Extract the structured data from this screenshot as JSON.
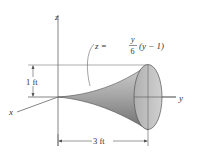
{
  "figure": {
    "axes": {
      "z_label": "z",
      "y_label": "y",
      "x_label": "x"
    },
    "equation": {
      "lhs": "z =",
      "numerator": "y",
      "denominator": "6",
      "factor": "(y − 1)"
    },
    "dimensions": {
      "height": "1 ft",
      "length": "3 ft"
    },
    "colors": {
      "line": "#555555",
      "surface_light": "#d9d9d9",
      "surface_dark": "#7a7a7a",
      "end_face": "#bdbdbd",
      "text": "#333333"
    }
  }
}
